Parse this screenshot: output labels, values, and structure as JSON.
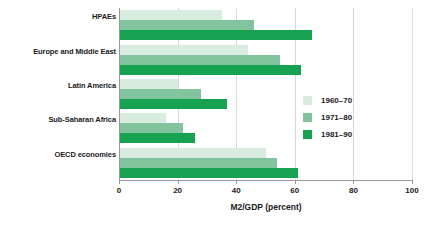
{
  "chart_data": {
    "type": "bar",
    "orientation": "horizontal",
    "title": "",
    "xlabel": "M2/GDP (percent)",
    "ylabel": "",
    "xlim": [
      0,
      100
    ],
    "xticks": [
      0,
      20,
      40,
      60,
      80,
      100
    ],
    "xtick_labels": [
      "0",
      "20",
      "40",
      "60",
      "80",
      "100"
    ],
    "grid": true,
    "legend_position": "center-right",
    "categories": [
      "HPAEs",
      "Europe and Middle East",
      "Latin America",
      "Sub-Saharan Africa",
      "OECD economies"
    ],
    "series": [
      {
        "name": "1960–70",
        "color": "#d9ece0",
        "values": [
          35,
          44,
          20,
          16,
          50
        ]
      },
      {
        "name": "1971–80",
        "color": "#82c49d",
        "values": [
          46,
          55,
          28,
          22,
          54
        ]
      },
      {
        "name": "1981–90",
        "color": "#17a252",
        "values": [
          66,
          62,
          37,
          26,
          61
        ]
      }
    ]
  },
  "axis": {
    "x_title": "M2/GDP (percent)"
  },
  "colors": {
    "series_1960_70": "#d9ece0",
    "series_1971_80": "#82c49d",
    "series_1981_90": "#17a252",
    "axis": "#9a9a9a",
    "grid": "#d8d8d8",
    "text": "#1a1a1a",
    "background": "#ffffff"
  }
}
